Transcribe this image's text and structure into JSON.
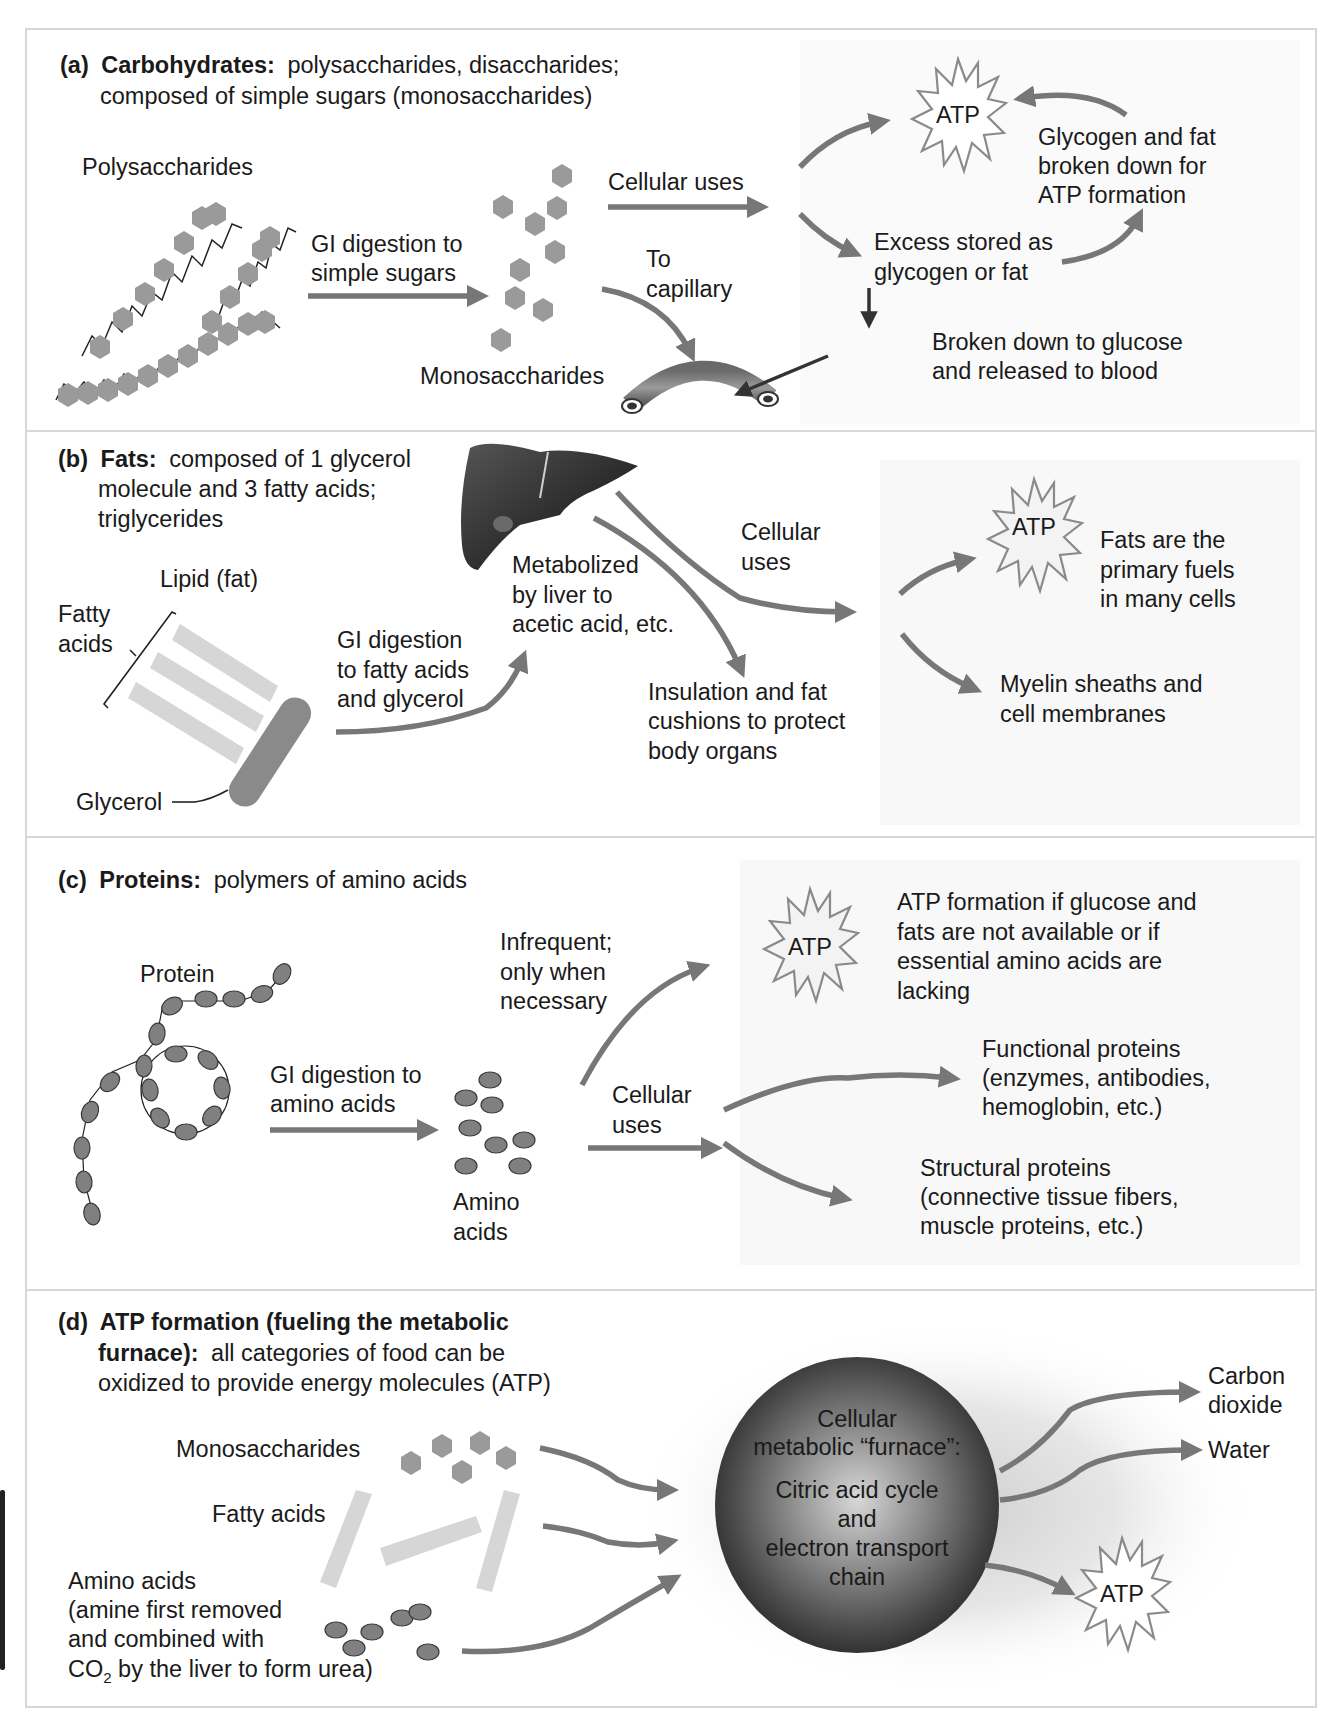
{
  "figure": {
    "sections": {
      "a": {
        "label": "(a)",
        "title_bold": "Carbohydrates:",
        "title_rest": "polysaccharides, disaccharides;",
        "title_line2": "composed of simple sugars (monosaccharides)",
        "polysaccharides": "Polysaccharides",
        "gi_digestion_line1": "GI digestion to",
        "gi_digestion_line2": "simple sugars",
        "monosaccharides": "Monosaccharides",
        "cellular_uses": "Cellular uses",
        "to_capillary_line1": "To",
        "to_capillary_line2": "capillary",
        "atp": "ATP",
        "glycogen_line1": "Glycogen and fat",
        "glycogen_line2": "broken down for",
        "glycogen_line3": "ATP formation",
        "excess_line1": "Excess stored as",
        "excess_line2": "glycogen or fat",
        "broken_line1": "Broken down to glucose",
        "broken_line2": "and released to blood"
      },
      "b": {
        "label": "(b)",
        "title_bold": "Fats:",
        "title_rest": "composed of 1 glycerol",
        "title_line2": "molecule and 3 fatty acids;",
        "title_line3": "triglycerides",
        "lipid": "Lipid (fat)",
        "fatty_line1": "Fatty",
        "fatty_line2": "acids",
        "glycerol": "Glycerol",
        "gi_line1": "GI digestion",
        "gi_line2": "to fatty acids",
        "gi_line3": "and glycerol",
        "metab_line1": "Metabolized",
        "metab_line2": "by liver to",
        "metab_line3": "acetic acid, etc.",
        "cellular_line1": "Cellular",
        "cellular_line2": "uses",
        "insul_line1": "Insulation and fat",
        "insul_line2": "cushions to protect",
        "insul_line3": "body organs",
        "atp": "ATP",
        "fats_line1": "Fats are the",
        "fats_line2": "primary fuels",
        "fats_line3": "in many cells",
        "myelin_line1": "Myelin sheaths and",
        "myelin_line2": "cell membranes"
      },
      "c": {
        "label": "(c)",
        "title_bold": "Proteins:",
        "title_rest": "polymers of amino acids",
        "protein": "Protein",
        "gi_line1": "GI digestion to",
        "gi_line2": "amino acids",
        "amino_line1": "Amino",
        "amino_line2": "acids",
        "infreq_line1": "Infrequent;",
        "infreq_line2": "only when",
        "infreq_line3": "necessary",
        "cellular_line1": "Cellular",
        "cellular_line2": "uses",
        "atp": "ATP",
        "atpform_line1": "ATP formation if glucose and",
        "atpform_line2": "fats are not available or if",
        "atpform_line3": "essential amino acids are",
        "atpform_line4": "lacking",
        "func_line1": "Functional proteins",
        "func_line2": "(enzymes, antibodies,",
        "func_line3": "hemoglobin, etc.)",
        "struct_line1": "Structural proteins",
        "struct_line2": "(connective tissue fibers,",
        "struct_line3": "muscle proteins, etc.)"
      },
      "d": {
        "label": "(d)",
        "title_bold_line1": "ATP formation (fueling the metabolic",
        "title_bold_line2": "furnace):",
        "title_rest_line2": "all categories of food can be",
        "title_line3": "oxidized to provide energy molecules (ATP)",
        "monosaccharides": "Monosaccharides",
        "fatty_acids": "Fatty acids",
        "amino_line1": "Amino acids",
        "amino_line2": "(amine first removed",
        "amino_line3": "and combined with",
        "amino_line4_pre": "CO",
        "amino_line4_sub": "2",
        "amino_line4_post": " by the liver to form urea)",
        "furnace_line1": "Cellular",
        "furnace_line2": "metabolic “furnace”:",
        "furnace_line3": "Citric acid cycle",
        "furnace_line4": "and",
        "furnace_line5": "electron transport",
        "furnace_line6": "chain",
        "co2_line1": "Carbon",
        "co2_line2": "dioxide",
        "water": "Water",
        "atp": "ATP"
      }
    },
    "colors": {
      "arrow": "#777777",
      "dark_arrow": "#333333",
      "molecule": "#9a9a9a",
      "fatty_acid": "#d6d6d6",
      "text": "#1a1a1a",
      "border": "#d8d8d8"
    }
  }
}
